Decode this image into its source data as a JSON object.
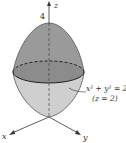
{
  "figure": {
    "axes": {
      "x": "x",
      "y": "y",
      "z": "z"
    },
    "z_tick": "4",
    "annotation": {
      "line1": "x² + y² = 2",
      "line2": "(z = 2)"
    },
    "colors": {
      "upper_surface": "#9a9a9a",
      "lower_surface": "#cfcfcf",
      "ellipse_top": "#8a8a8a",
      "stroke": "#333333"
    }
  }
}
